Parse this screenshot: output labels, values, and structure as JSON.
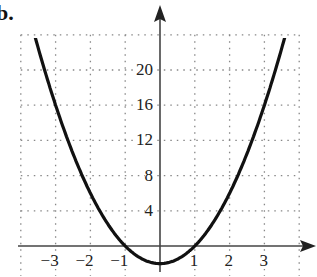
{
  "part_label": "b.",
  "chart_data": {
    "type": "line",
    "title": "",
    "xlabel": "",
    "ylabel": "",
    "function": "y = 2x^2 - 2",
    "x_ticks": [
      -3,
      -2,
      -1,
      1,
      2,
      3
    ],
    "x_tick_labels": [
      "−3",
      "−2",
      "−1",
      "1",
      "2",
      "3"
    ],
    "y_ticks": [
      4,
      8,
      12,
      16,
      20
    ],
    "y_tick_labels": [
      "4",
      "8",
      "12",
      "16",
      "20"
    ],
    "xlim": [
      -4,
      4
    ],
    "ylim": [
      -3,
      24
    ],
    "grid": true,
    "grid_style": "dotted",
    "series": [
      {
        "name": "parabola",
        "x": [
          -3.9,
          -3,
          -2,
          -1,
          0,
          1,
          2,
          3,
          3.9
        ],
        "y": [
          28.4,
          16,
          6,
          0,
          -2,
          0,
          6,
          16,
          28.4
        ],
        "color": "#111111"
      }
    ],
    "key_points": {
      "vertex": [
        0,
        -2
      ],
      "x_intercepts": [
        -1,
        1
      ]
    }
  }
}
